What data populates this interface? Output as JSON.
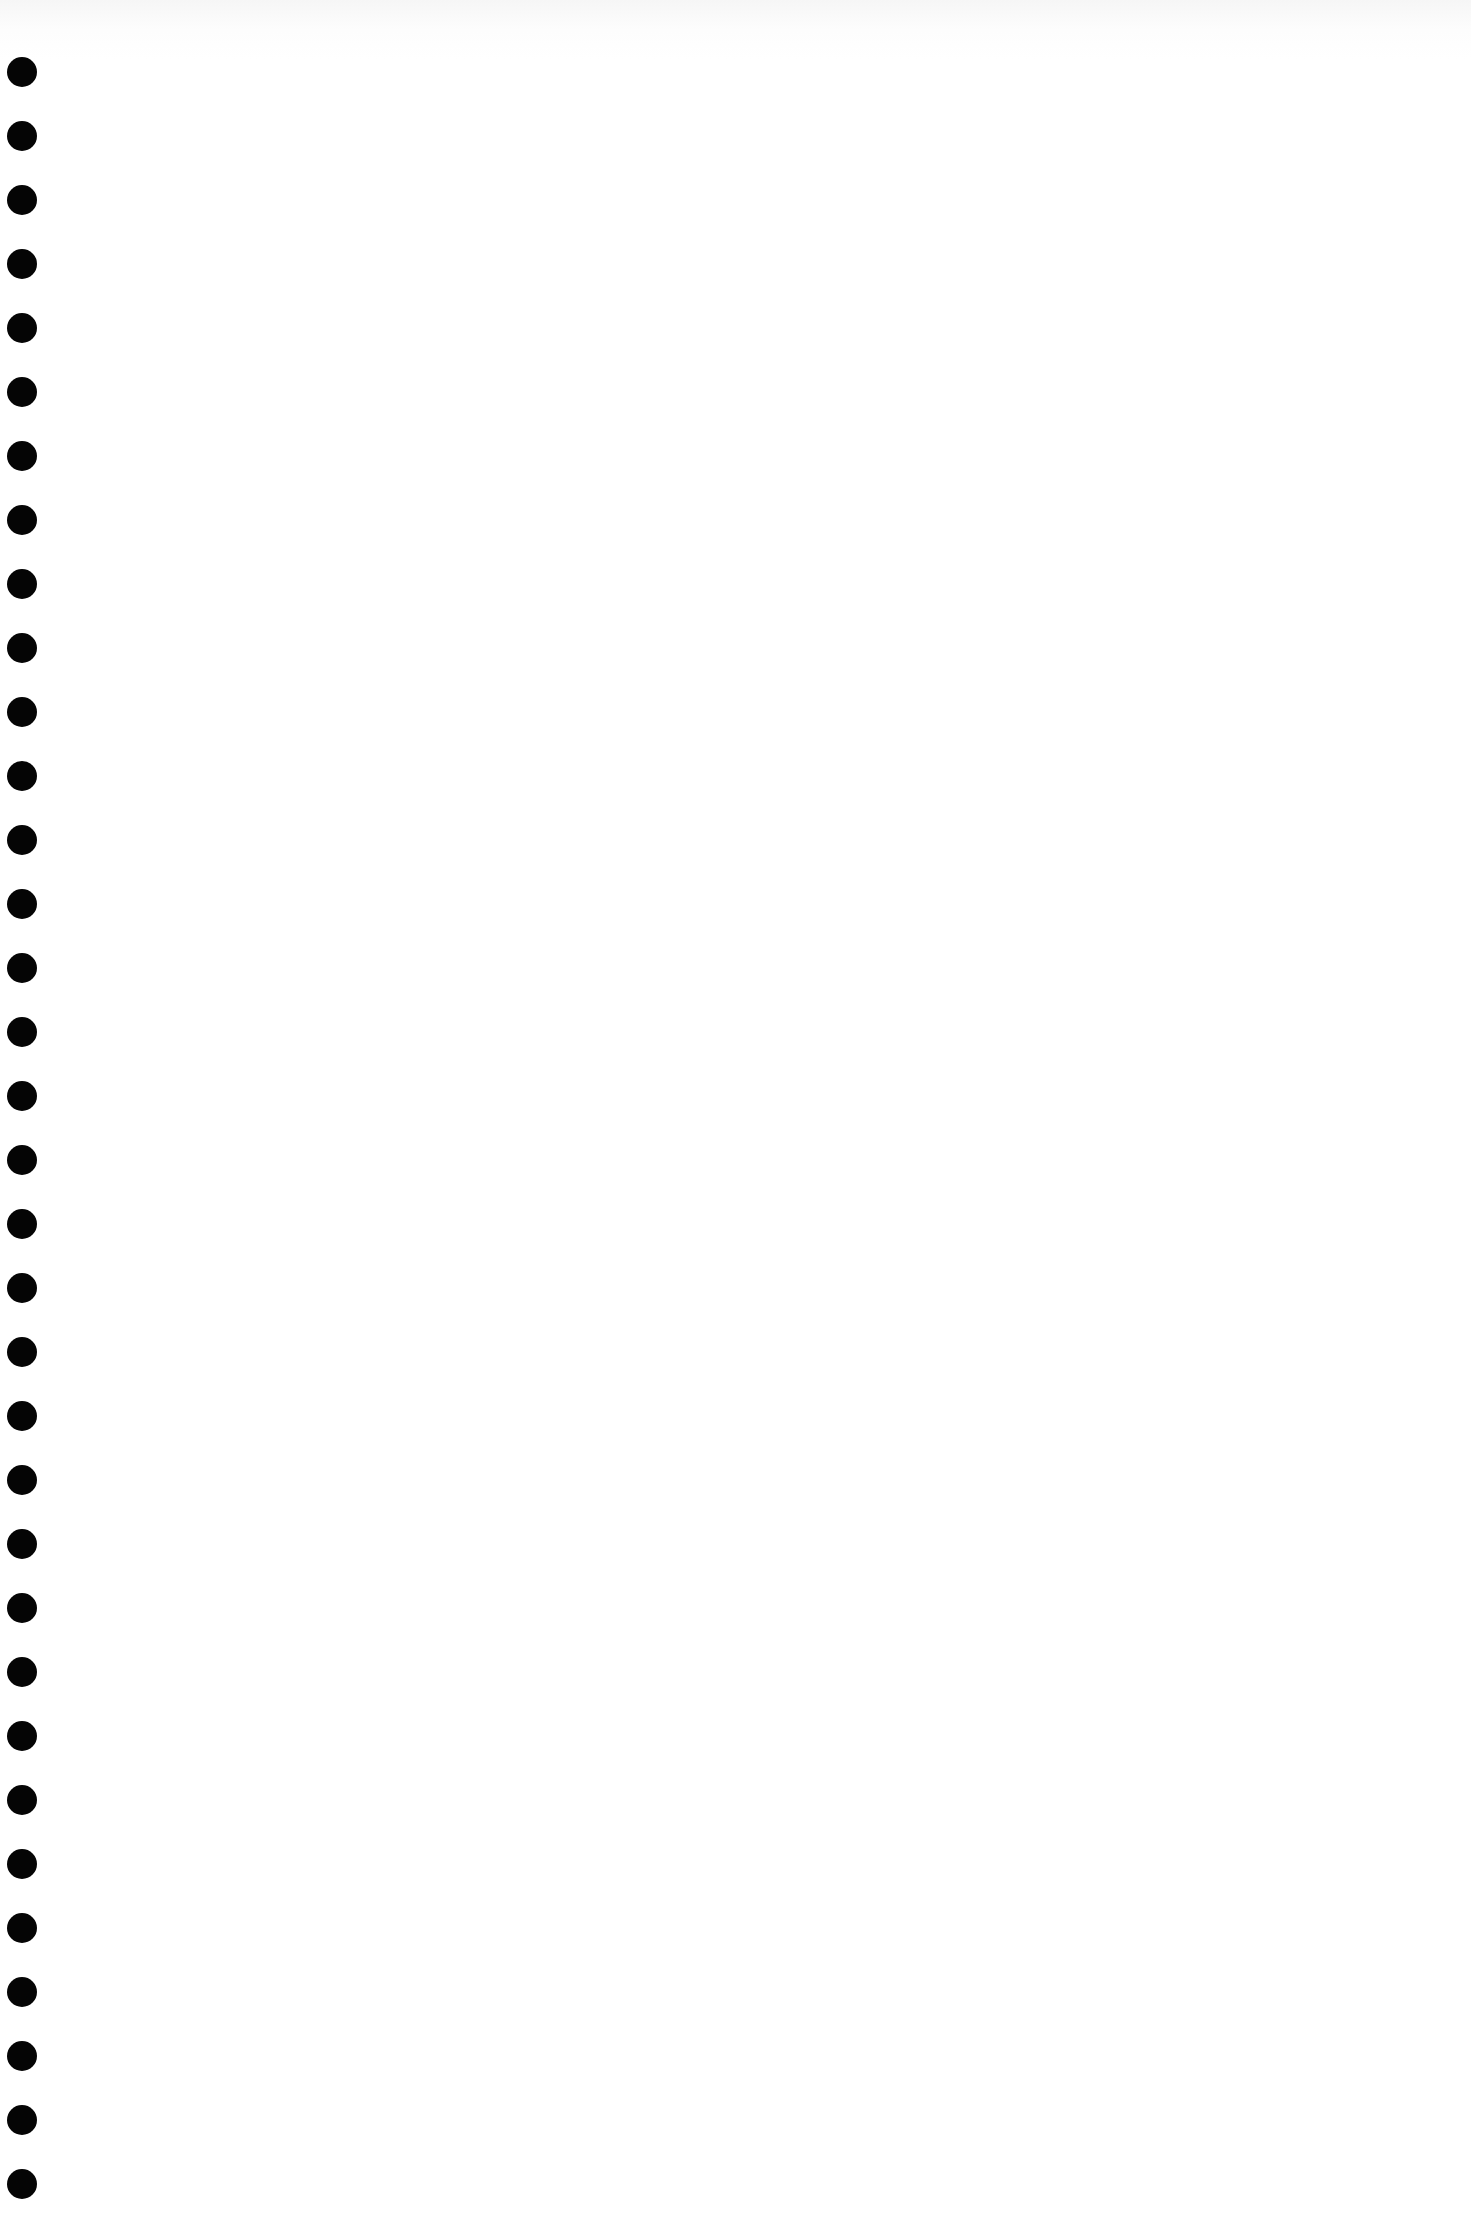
{
  "page": {
    "type": "blank-paper-sheet",
    "background_color": "#ffffff",
    "hole_color": "#050505",
    "holes": {
      "count": 34,
      "center_x": 22,
      "first_center_y": 72,
      "spacing": 64,
      "diameter": 30
    }
  }
}
